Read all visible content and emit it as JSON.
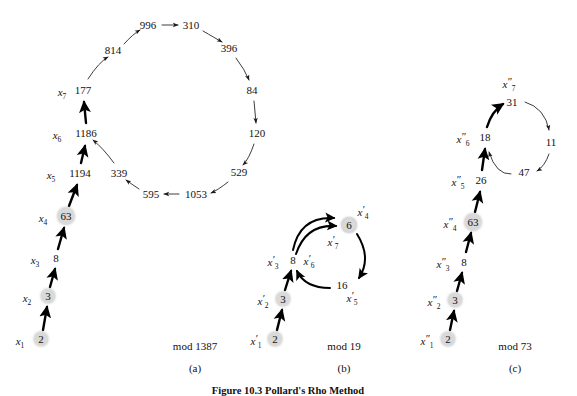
{
  "figure": {
    "caption": "Figure 10.3  Pollard's Rho Method",
    "panels": [
      {
        "id": "a",
        "panel_label": "(a)",
        "modulus_label": "mod 1387",
        "label_x": 195,
        "label_y": 346,
        "cap_x": 195,
        "cap_y": 368
      },
      {
        "id": "b",
        "panel_label": "(b)",
        "modulus_label": "mod 19",
        "label_x": 344,
        "label_y": 346,
        "cap_x": 344,
        "cap_y": 368
      },
      {
        "id": "c",
        "panel_label": "(c)",
        "modulus_label": "mod 73",
        "label_x": 515,
        "label_y": 346,
        "cap_x": 515,
        "cap_y": 368
      }
    ]
  },
  "graph_a": {
    "modulus": 1387,
    "tail": [
      {
        "value": "2",
        "var": "x",
        "sub": "1",
        "prime": "",
        "x": 41,
        "y": 339,
        "shaded": true,
        "label_x": 20,
        "label_y": 341
      },
      {
        "value": "3",
        "var": "x",
        "sub": "2",
        "prime": "",
        "x": 48,
        "y": 296,
        "shaded": true,
        "label_x": 27,
        "label_y": 298
      },
      {
        "value": "8",
        "var": "x",
        "sub": "3",
        "prime": "",
        "x": 56,
        "y": 258,
        "shaded": false,
        "label_x": 35,
        "label_y": 260
      },
      {
        "value": "63",
        "var": "x",
        "sub": "4",
        "prime": "",
        "x": 66,
        "y": 216,
        "shaded": true,
        "label_x": 43,
        "label_y": 218
      },
      {
        "value": "1194",
        "var": "x",
        "sub": "5",
        "prime": "",
        "x": 80,
        "y": 173,
        "shaded": false,
        "label_x": 51,
        "label_y": 175
      },
      {
        "value": "1186",
        "var": "x",
        "sub": "6",
        "prime": "",
        "x": 86,
        "y": 133,
        "shaded": false,
        "label_x": 57,
        "label_y": 135
      },
      {
        "value": "177",
        "var": "x",
        "sub": "7",
        "prime": "",
        "x": 83,
        "y": 90,
        "shaded": false,
        "label_x": 62,
        "label_y": 92
      }
    ],
    "cycle": [
      {
        "value": "814",
        "x": 113,
        "y": 50
      },
      {
        "value": "996",
        "x": 148,
        "y": 25
      },
      {
        "value": "310",
        "x": 191,
        "y": 25
      },
      {
        "value": "396",
        "x": 229,
        "y": 48
      },
      {
        "value": "84",
        "x": 252,
        "y": 90
      },
      {
        "value": "120",
        "x": 257,
        "y": 133
      },
      {
        "value": "529",
        "x": 239,
        "y": 172
      },
      {
        "value": "1053",
        "x": 196,
        "y": 194
      },
      {
        "value": "595",
        "x": 151,
        "y": 194
      },
      {
        "value": "339",
        "x": 119,
        "y": 173
      }
    ]
  },
  "graph_b": {
    "modulus": 19,
    "tail": [
      {
        "value": "2",
        "var": "x",
        "sub": "1",
        "prime": "′",
        "x": 275,
        "y": 339,
        "shaded": true,
        "label_x": 256,
        "label_y": 341
      },
      {
        "value": "3",
        "var": "x",
        "sub": "2",
        "prime": "′",
        "x": 283,
        "y": 299,
        "shaded": true,
        "label_x": 263,
        "label_y": 301
      },
      {
        "value": "8",
        "var": "x",
        "sub": "3",
        "prime": "′",
        "x": 293,
        "y": 260,
        "shaded": false,
        "label_x": 273,
        "label_y": 262
      }
    ],
    "cycle": [
      {
        "value": "6",
        "var": "x",
        "sub": "4",
        "prime": "′",
        "x": 349,
        "y": 225,
        "shaded": true,
        "label_x": 363,
        "label_y": 212
      },
      {
        "value": "16",
        "var": "x",
        "sub": "5",
        "prime": "′",
        "x": 342,
        "y": 285,
        "shaded": false,
        "label_x": 352,
        "label_y": 298
      },
      {
        "value": "8",
        "var": "x",
        "sub": "6",
        "prime": "′",
        "x": 293,
        "y": 260,
        "shaded": false,
        "label_x": 309,
        "label_y": 261
      },
      {
        "value": "6",
        "var": "x",
        "sub": "7",
        "prime": "′",
        "x": 349,
        "y": 225,
        "shaded": true,
        "label_x": 333,
        "label_y": 242
      }
    ]
  },
  "graph_c": {
    "modulus": 73,
    "tail": [
      {
        "value": "2",
        "var": "x",
        "sub": "1",
        "prime": "″",
        "x": 448,
        "y": 339,
        "shaded": true,
        "label_x": 427,
        "label_y": 341
      },
      {
        "value": "3",
        "var": "x",
        "sub": "2",
        "prime": "″",
        "x": 455,
        "y": 300,
        "shaded": true,
        "label_x": 434,
        "label_y": 302
      },
      {
        "value": "8",
        "var": "x",
        "sub": "3",
        "prime": "″",
        "x": 464,
        "y": 262,
        "shaded": false,
        "label_x": 443,
        "label_y": 264
      },
      {
        "value": "63",
        "var": "x",
        "sub": "4",
        "prime": "″",
        "x": 473,
        "y": 222,
        "shaded": true,
        "label_x": 450,
        "label_y": 224
      },
      {
        "value": "26",
        "var": "x",
        "sub": "5",
        "prime": "″",
        "x": 481,
        "y": 180,
        "shaded": false,
        "label_x": 458,
        "label_y": 182
      },
      {
        "value": "18",
        "var": "x",
        "sub": "6",
        "prime": "″",
        "x": 485,
        "y": 137,
        "shaded": false,
        "label_x": 463,
        "label_y": 139
      },
      {
        "value": "31",
        "var": "x",
        "sub": "7",
        "prime": "″",
        "x": 512,
        "y": 102,
        "shaded": false,
        "label_x": 509,
        "label_y": 84
      }
    ],
    "cycle": [
      {
        "value": "11",
        "x": 551,
        "y": 142
      },
      {
        "value": "47",
        "x": 524,
        "y": 172
      }
    ]
  }
}
